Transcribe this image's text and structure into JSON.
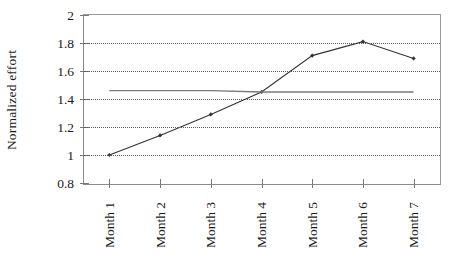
{
  "chart_data": {
    "type": "line",
    "title": "",
    "xlabel": "",
    "ylabel": "Normalized effort",
    "categories": [
      "Month 1",
      "Month 2",
      "Month 3",
      "Month 4",
      "Month 5",
      "Month 6",
      "Month 7"
    ],
    "series": [
      {
        "name": "Normalized effort",
        "marker": "diamond",
        "color": "#333333",
        "values": [
          1.0,
          1.14,
          1.29,
          1.45,
          1.71,
          1.81,
          1.69
        ]
      },
      {
        "name": "Reference level",
        "marker": "none",
        "color": "#7a7a7a",
        "values": [
          1.46,
          1.46,
          1.46,
          1.45,
          1.45,
          1.45,
          1.45
        ]
      }
    ],
    "ylim": [
      0.8,
      2.0
    ],
    "ytick_values": [
      0.8,
      1.0,
      1.2,
      1.4,
      1.6,
      1.8,
      2.0
    ],
    "ytick_labels": [
      "0.8",
      "1",
      "1.2",
      "1.4",
      "1.6",
      "1.8",
      "2"
    ],
    "grid": "horizontal-dotted",
    "legend": "none",
    "axis_color": "#8a8a8a",
    "gridline_color": "#5a5a5a",
    "background": "#ffffff"
  }
}
